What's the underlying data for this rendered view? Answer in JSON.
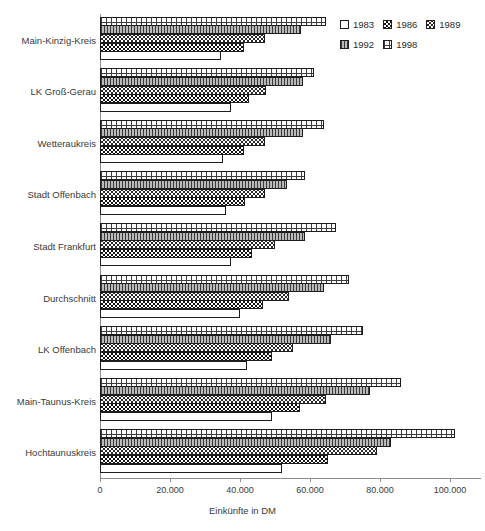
{
  "chart_data": {
    "type": "bar",
    "orientation": "horizontal",
    "title": "",
    "xlabel": "Einkünfte in DM",
    "ylabel": "",
    "xlim": [
      0,
      110000
    ],
    "xticks": [
      0,
      20000,
      40000,
      60000,
      80000,
      100000
    ],
    "xtick_labels": [
      "0",
      "20.000",
      "40.000",
      "60.000",
      "80.000",
      "100.000"
    ],
    "grid": false,
    "legend_position": "top-right",
    "categories": [
      "Main-Kinzig-Kreis",
      "LK Groß-Gerau",
      "Wetteraukreis",
      "Stadt Offenbach",
      "Stadt Frankfurt",
      "Durchschnitt",
      "LK Offenbach",
      "Main-Taunus-Kreis",
      "Hochtaunuskreis"
    ],
    "series": [
      {
        "name": "1983",
        "pattern": "white-empty",
        "values": [
          34500,
          37500,
          35000,
          36000,
          37500,
          40000,
          42000,
          49000,
          52000
        ]
      },
      {
        "name": "1986",
        "pattern": "black-dotted",
        "values": [
          41000,
          42500,
          41000,
          41500,
          43500,
          46500,
          49000,
          57000,
          65000
        ]
      },
      {
        "name": "1989",
        "pattern": "white-zigzag",
        "values": [
          47000,
          47500,
          47000,
          47000,
          50000,
          54000,
          55000,
          64500,
          79000
        ]
      },
      {
        "name": "1992",
        "pattern": "grey-vertical-lines",
        "values": [
          57500,
          58000,
          58000,
          53500,
          58500,
          64000,
          66000,
          77000,
          83000
        ]
      },
      {
        "name": "1998",
        "pattern": "white-grid-dots",
        "values": [
          64500,
          61000,
          64000,
          58500,
          67500,
          71000,
          75000,
          86000,
          101500
        ]
      }
    ]
  },
  "legend": {
    "rows": [
      [
        "1983",
        "1986",
        "1989"
      ],
      [
        "1992",
        "1998"
      ]
    ]
  }
}
